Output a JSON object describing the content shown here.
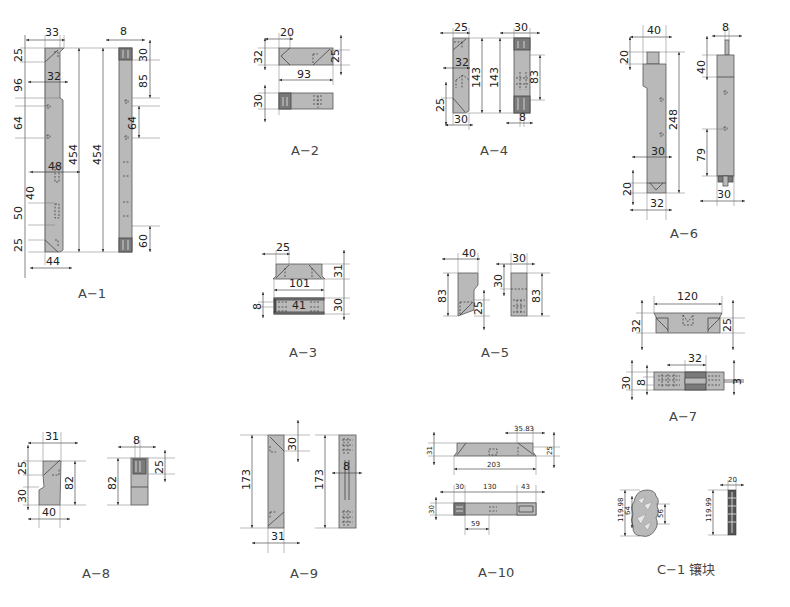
{
  "drawing": {
    "parts": [
      {
        "id": "A-1",
        "caption": "A−1",
        "dims": {
          "top_width": "33",
          "upper_width": "32",
          "mid_width": "48",
          "bottom_width": "44",
          "top_chamfer": "25",
          "step": "96",
          "hole_spacing": "64",
          "slot1": "40",
          "slot2": "50",
          "bottom_chamfer": "25",
          "length_front": "454",
          "length_side": "454",
          "side_width": "8",
          "side_top": "30",
          "side_step": "85",
          "side_holes": "64",
          "side_bottom": "60"
        }
      },
      {
        "id": "A-2",
        "caption": "A−2",
        "dims": {
          "chamfer_width": "20",
          "height": "32",
          "length": "93",
          "right_height": "25",
          "side_height": "30"
        }
      },
      {
        "id": "A-3",
        "caption": "A−3",
        "dims": {
          "chamfer_width": "25",
          "height": "31",
          "length": "101",
          "center": "41",
          "side_height": "30",
          "slot": "8"
        }
      },
      {
        "id": "A-4",
        "caption": "A−4",
        "dims": {
          "top_width": "25",
          "inner": "32",
          "length1": "143",
          "length2": "143",
          "bottom_chamfer": "25",
          "bottom_width": "30",
          "side_width": "30",
          "side_height": "83",
          "side_slot": "8"
        }
      },
      {
        "id": "A-5",
        "caption": "A−5",
        "dims": {
          "width": "40",
          "height": "83",
          "step": "25",
          "side_width": "30",
          "side_top": "30",
          "side_height": "83"
        }
      },
      {
        "id": "A-6",
        "caption": "A−6",
        "dims": {
          "top_width": "40",
          "tab": "20",
          "length": "248",
          "mid_width": "30",
          "tip": "20",
          "bottom_width": "32",
          "side_pin": "8",
          "side_top": "40",
          "side_bottom": "79",
          "side_width": "30"
        }
      },
      {
        "id": "A-7",
        "caption": "A−7",
        "dims": {
          "length": "120",
          "height": "32",
          "right_height": "25",
          "center": "32",
          "side_height": "30",
          "slot": "8",
          "pin": "3"
        }
      },
      {
        "id": "A-8",
        "caption": "A−8",
        "dims": {
          "top_width": "31",
          "chamfer": "25",
          "step": "30",
          "height": "82",
          "bottom_width": "40",
          "side_width": "8",
          "side_height": "82",
          "side_top": "25"
        }
      },
      {
        "id": "A-9",
        "caption": "A−9",
        "dims": {
          "length": "173",
          "chamfer": "30",
          "width": "31",
          "side_length": "173",
          "side_slot": "8"
        }
      },
      {
        "id": "A-10",
        "caption": "A−10",
        "dims": {
          "chamfer": "35.83",
          "height": "31",
          "right_height": "25",
          "length": "203",
          "seg1": "30",
          "seg2": "130",
          "seg3": "43",
          "side_height": "30",
          "offset": "59"
        }
      },
      {
        "id": "C-1",
        "caption": "C−1 镶块",
        "dims": {
          "height": "119.98",
          "inner": "64",
          "right": "56",
          "side_width": "20",
          "side_height": "119.99"
        }
      }
    ]
  },
  "colors": {
    "part_fill": "#b9b9b9",
    "dark_fill": "#555555",
    "line": "#333333"
  }
}
